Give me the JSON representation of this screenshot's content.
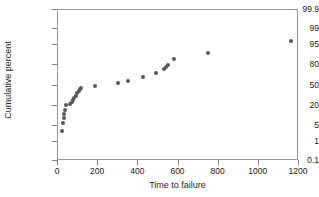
{
  "chart_data": {
    "type": "scatter",
    "title": "",
    "subtitle": "",
    "xlabel": "Time to failure",
    "ylabel": "Cumulative percent",
    "xlim": [
      0,
      1200
    ],
    "ylim": [
      0.1,
      99.9
    ],
    "yscale": "normal-probability",
    "grid": false,
    "legend": null,
    "legend_position": "none",
    "point_color": "#58585a",
    "axis_color": "#9a9a9a",
    "xticks": [
      0,
      200,
      400,
      600,
      800,
      1000,
      1200
    ],
    "xtick_labels": [
      "0",
      "200",
      "400",
      "600",
      "800",
      "1000",
      "1200"
    ],
    "yticks": [
      0.1,
      1,
      5,
      20,
      50,
      80,
      95,
      99,
      99.9
    ],
    "ytick_labels": [
      "0.1",
      "1",
      "5",
      "20",
      "50",
      "80",
      "95",
      "99",
      "99.9"
    ],
    "series": [
      {
        "name": "failures",
        "x": [
          18,
          26,
          28,
          31,
          35,
          42,
          62,
          70,
          76,
          82,
          90,
          96,
          103,
          110,
          115,
          185,
          300,
          348,
          422,
          487,
          528,
          538,
          548,
          580,
          748,
          1158
        ],
        "y": [
          3.0,
          6.0,
          9.0,
          12.0,
          15.5,
          21.0,
          22.0,
          25.0,
          28.0,
          31.0,
          34.0,
          37.5,
          41.0,
          44.0,
          46.0,
          49.0,
          54.0,
          58.0,
          63.0,
          70.0,
          75.0,
          78.0,
          79.5,
          86.0,
          91.0,
          96.5
        ]
      }
    ]
  },
  "axes": {
    "ylabel_text": "Cumulative percent",
    "xlabel_text": "Time to failure"
  }
}
